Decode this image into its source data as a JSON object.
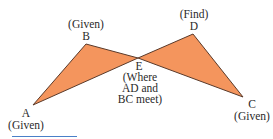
{
  "diagram": {
    "type": "geometry-two-triangles",
    "colors": {
      "fill": "#f4955d",
      "stroke": "#5a3a2a",
      "text": "#2a2a2a",
      "underline": "#4a7fc8"
    },
    "points": {
      "A": {
        "x": 33,
        "y": 105
      },
      "B": {
        "x": 86,
        "y": 44
      },
      "E": {
        "x": 138,
        "y": 58
      },
      "D": {
        "x": 193,
        "y": 34
      },
      "C": {
        "x": 243,
        "y": 97
      }
    },
    "triangles": [
      {
        "name": "ABE",
        "vertices": [
          "A",
          "B",
          "E"
        ]
      },
      {
        "name": "EDC",
        "vertices": [
          "E",
          "D",
          "C"
        ]
      }
    ],
    "labels": {
      "B": {
        "name": "B",
        "note": "(Given)"
      },
      "D": {
        "name": "D",
        "note": "(Find)"
      },
      "A": {
        "name": "A",
        "note": "(Given)"
      },
      "C": {
        "name": "C",
        "note": "(Given)"
      },
      "E": {
        "name": "E",
        "note_line1": "(Where",
        "note_line2": "AD and",
        "note_line3": "BC meet)"
      }
    }
  }
}
